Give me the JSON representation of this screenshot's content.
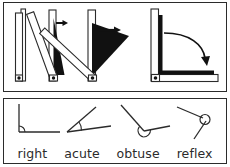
{
  "figure": {
    "width": 230,
    "height": 167,
    "background": "#ffffff",
    "ink": "#2b2b2b",
    "fill_white": "#ffffff",
    "fill_black": "#111111"
  },
  "panels": [
    {
      "name": "folding-ruler-sequence",
      "caption": "",
      "steps": [
        {
          "step": 1,
          "label": "",
          "angle_degrees": 0,
          "description": "folding ruler closed, both arms vertical together"
        },
        {
          "step": 2,
          "label": "",
          "angle_degrees": 20,
          "description": "ruler opening slightly, arrow pointing right"
        },
        {
          "step": 3,
          "label": "",
          "angle_degrees": 45,
          "description": "ruler opened to about 45 degrees, arrow pointing right"
        },
        {
          "step": 4,
          "label": "",
          "angle_degrees": 90,
          "description": "ruler opened to a right angle, curved arrow sweeping down"
        }
      ]
    },
    {
      "name": "angle-types",
      "items": [
        {
          "label": "right",
          "angle_degrees": 90,
          "marker": "square"
        },
        {
          "label": "acute",
          "angle_degrees": 35,
          "marker": "arc"
        },
        {
          "label": "obtuse",
          "angle_degrees": 125,
          "marker": "arc"
        },
        {
          "label": "reflex",
          "angle_degrees": 290,
          "marker": "circle"
        }
      ]
    }
  ]
}
